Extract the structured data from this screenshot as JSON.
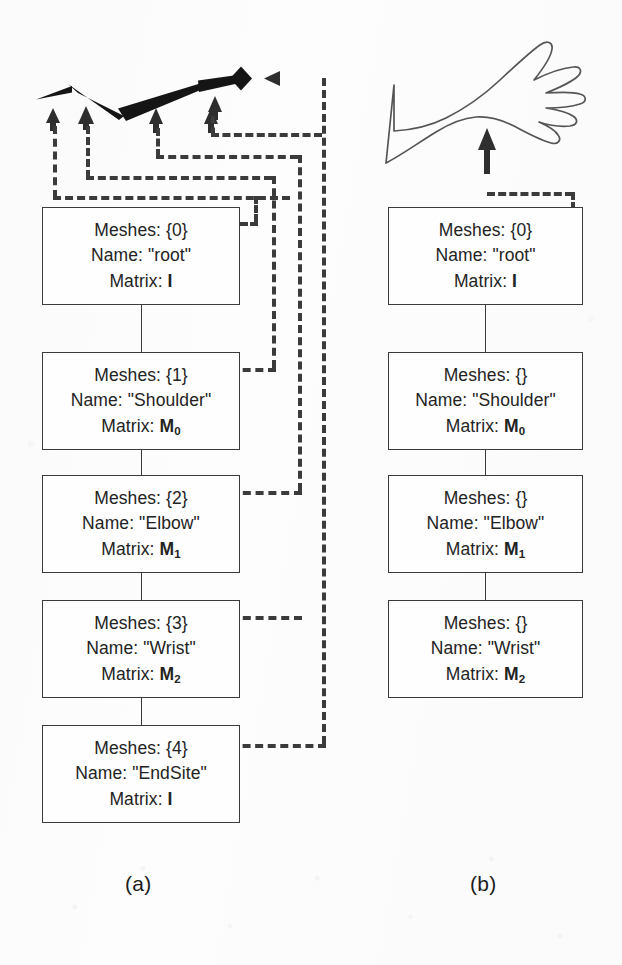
{
  "figure": {
    "captions": [
      {
        "id": "a",
        "label": "(a)"
      },
      {
        "id": "b",
        "label": "(b)"
      }
    ]
  },
  "panel_a": {
    "id": "panel-a",
    "graphic": {
      "name": "skeleton-bone-chain",
      "description": "stylised bone chain with tapered segments and an end-site diamond"
    },
    "nodes": [
      {
        "index": 0,
        "meshes_label": "Meshes:",
        "meshes_value": "{0}",
        "name_label": "Name:",
        "name_value": "\"root\"",
        "matrix_label": "Matrix:",
        "matrix_value": "I",
        "matrix_sub": ""
      },
      {
        "index": 1,
        "meshes_label": "Meshes:",
        "meshes_value": "{1}",
        "name_label": "Name:",
        "name_value": "\"Shoulder\"",
        "matrix_label": "Matrix:",
        "matrix_value": "M",
        "matrix_sub": "0"
      },
      {
        "index": 2,
        "meshes_label": "Meshes:",
        "meshes_value": "{2}",
        "name_label": "Name:",
        "name_value": "\"Elbow\"",
        "matrix_label": "Matrix:",
        "matrix_value": "M",
        "matrix_sub": "1"
      },
      {
        "index": 3,
        "meshes_label": "Meshes:",
        "meshes_value": "{3}",
        "name_label": "Name:",
        "name_value": "\"Wrist\"",
        "matrix_label": "Matrix:",
        "matrix_value": "M",
        "matrix_sub": "2"
      },
      {
        "index": 4,
        "meshes_label": "Meshes:",
        "meshes_value": "{4}",
        "name_label": "Name:",
        "name_value": "\"EndSite\"",
        "matrix_label": "Matrix:",
        "matrix_value": "I",
        "matrix_sub": ""
      }
    ]
  },
  "panel_b": {
    "id": "panel-b",
    "graphic": {
      "name": "arm-outline-illustration",
      "description": "line drawing of a human arm and open hand"
    },
    "nodes": [
      {
        "index": 0,
        "meshes_label": "Meshes:",
        "meshes_value": "{0}",
        "name_label": "Name:",
        "name_value": "\"root\"",
        "matrix_label": "Matrix:",
        "matrix_value": "I",
        "matrix_sub": ""
      },
      {
        "index": 1,
        "meshes_label": "Meshes:",
        "meshes_value": "{}",
        "name_label": "Name:",
        "name_value": "\"Shoulder\"",
        "matrix_label": "Matrix:",
        "matrix_value": "M",
        "matrix_sub": "0"
      },
      {
        "index": 2,
        "meshes_label": "Meshes:",
        "meshes_value": "{}",
        "name_label": "Name:",
        "name_value": "\"Elbow\"",
        "matrix_label": "Matrix:",
        "matrix_value": "M",
        "matrix_sub": "1"
      },
      {
        "index": 3,
        "meshes_label": "Meshes:",
        "meshes_value": "{}",
        "name_label": "Name:",
        "name_value": "\"Wrist\"",
        "matrix_label": "Matrix:",
        "matrix_value": "M",
        "matrix_sub": "2"
      }
    ]
  },
  "colors": {
    "ink": "#3a3a3a",
    "text": "#232323",
    "paper": "#fdfdfd",
    "bone_fill": "#151515"
  }
}
